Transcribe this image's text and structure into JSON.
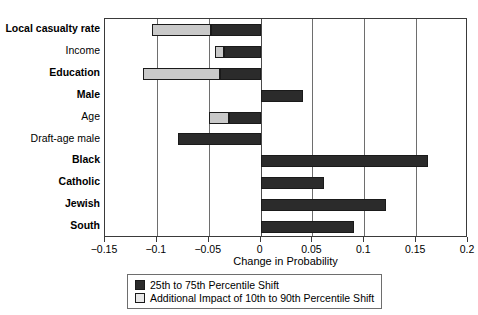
{
  "chart_data": {
    "type": "bar",
    "orientation": "horizontal",
    "title": "",
    "xlabel": "Change in Probability",
    "ylabel": "",
    "xlim": [
      -0.15,
      0.2
    ],
    "xticks": [
      -0.15,
      -0.1,
      -0.05,
      0,
      0.05,
      0.1,
      0.15,
      0.2
    ],
    "xtick_labels": [
      "-0.15",
      "-0.1",
      "-0.05",
      "0",
      "0.05",
      "0.1",
      "0.15",
      "0.2"
    ],
    "grid": "vertical",
    "legend_position": "bottom-center",
    "categories": [
      "Local casualty rate",
      "Income",
      "Education",
      "Male",
      "Age",
      "Draft-age male",
      "Black",
      "Catholic",
      "Jewish",
      "South"
    ],
    "category_emphasis": [
      "bold",
      "normal",
      "bold",
      "bold",
      "normal",
      "normal",
      "bold",
      "bold",
      "bold",
      "bold"
    ],
    "series": [
      {
        "name": "25th to 75th Percentile Shift",
        "color": "#2b2b2b",
        "values": [
          -0.048,
          -0.035,
          -0.039,
          0.041,
          -0.03,
          -0.08,
          0.161,
          0.061,
          0.121,
          0.09
        ]
      },
      {
        "name": "Additional Impact of 10th to 90th Percentile Shift",
        "color": "#c9c9c9",
        "values": [
          -0.057,
          -0.009,
          -0.074,
          0.0,
          -0.02,
          0.0,
          0.0,
          0.0,
          0.0,
          0.0
        ]
      }
    ],
    "bar_extents": [
      {
        "category": "Local casualty rate",
        "dark_from": -0.048,
        "dark_to": 0.0,
        "light_from": -0.105,
        "light_to": -0.048
      },
      {
        "category": "Income",
        "dark_from": -0.035,
        "dark_to": 0.0,
        "light_from": -0.044,
        "light_to": -0.035
      },
      {
        "category": "Education",
        "dark_from": -0.039,
        "dark_to": 0.0,
        "light_from": -0.113,
        "light_to": -0.039
      },
      {
        "category": "Male",
        "dark_from": 0.0,
        "dark_to": 0.041,
        "light_from": 0.0,
        "light_to": 0.0
      },
      {
        "category": "Age",
        "dark_from": -0.03,
        "dark_to": 0.0,
        "light_from": -0.05,
        "light_to": -0.03
      },
      {
        "category": "Draft-age male",
        "dark_from": -0.08,
        "dark_to": 0.0,
        "light_from": 0.0,
        "light_to": 0.0
      },
      {
        "category": "Black",
        "dark_from": 0.0,
        "dark_to": 0.161,
        "light_from": 0.0,
        "light_to": 0.0
      },
      {
        "category": "Catholic",
        "dark_from": 0.0,
        "dark_to": 0.061,
        "light_from": 0.0,
        "light_to": 0.0
      },
      {
        "category": "Jewish",
        "dark_from": 0.0,
        "dark_to": 0.121,
        "light_from": 0.0,
        "light_to": 0.0
      },
      {
        "category": "South",
        "dark_from": 0.0,
        "dark_to": 0.09,
        "light_from": 0.0,
        "light_to": 0.0
      }
    ]
  },
  "legend": {
    "items": [
      {
        "label": "25th to 75th Percentile Shift",
        "swatch": "dark"
      },
      {
        "label": "Additional Impact of 10th to 90th Percentile Shift",
        "swatch": "light"
      }
    ]
  },
  "colors": {
    "dark_bar": "#2b2b2b",
    "light_bar": "#c9c9c9",
    "gridline": "#6e6e6e",
    "axis": "#3a3a3a",
    "background": "#ffffff"
  }
}
